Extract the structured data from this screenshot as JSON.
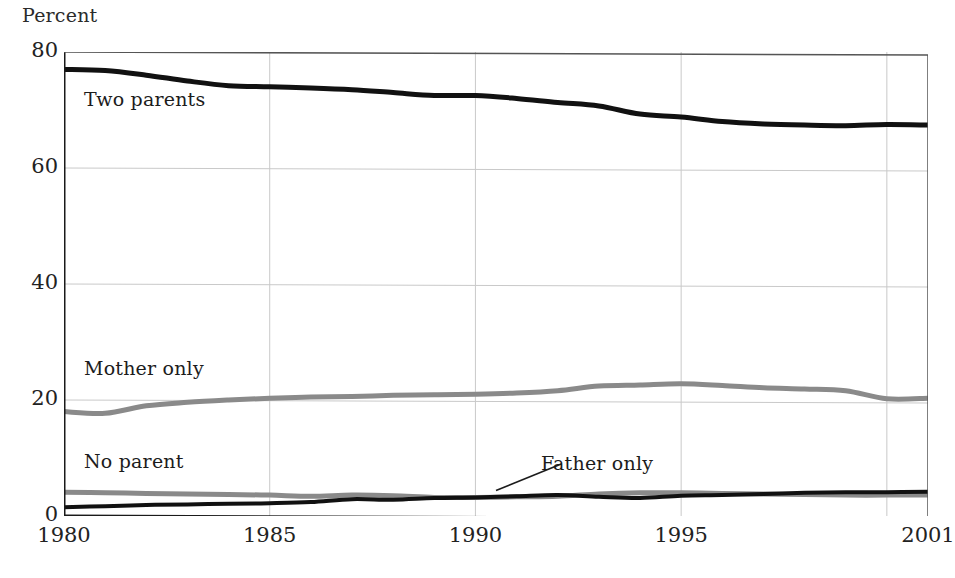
{
  "chart_data": {
    "type": "line",
    "title": "",
    "subtitle": "",
    "xlabel": "",
    "ylabel": "Percent",
    "xlim": [
      1980,
      2001
    ],
    "ylim": [
      0,
      80
    ],
    "grid": true,
    "legend_position": "inline-labels",
    "x_ticks": [
      "1980",
      "1985",
      "1990",
      "1995",
      "2001"
    ],
    "x_tick_values": [
      1980,
      1985,
      1990,
      1995,
      2001
    ],
    "y_ticks": [
      "0",
      "20",
      "40",
      "60",
      "80"
    ],
    "y_tick_values": [
      0,
      20,
      40,
      60,
      80
    ],
    "x": [
      1980,
      1981,
      1982,
      1983,
      1984,
      1985,
      1986,
      1987,
      1988,
      1989,
      1990,
      1991,
      1992,
      1993,
      1994,
      1995,
      1996,
      1997,
      1998,
      1999,
      2000,
      2001
    ],
    "series": [
      {
        "name": "Two parents",
        "color": "#111111",
        "width": 5,
        "values": [
          77,
          76.8,
          76,
          75,
          74.2,
          74,
          73.8,
          73.5,
          73,
          72.5,
          72.5,
          72,
          71.3,
          70.7,
          69.3,
          68.8,
          68,
          67.6,
          67.4,
          67.3,
          67.5,
          67.4
        ]
      },
      {
        "name": "Mother only",
        "color": "#8a8a8a",
        "width": 5,
        "values": [
          18,
          17.7,
          19,
          19.6,
          20,
          20.3,
          20.5,
          20.6,
          20.8,
          20.9,
          21,
          21.2,
          21.6,
          22.4,
          22.6,
          22.8,
          22.5,
          22.1,
          21.9,
          21.6,
          20.2,
          20.3
        ]
      },
      {
        "name": "No parent",
        "color": "#8a8a8a",
        "width": 5,
        "values": [
          4.1,
          4,
          3.9,
          3.8,
          3.7,
          3.6,
          3.4,
          3.6,
          3.5,
          3.2,
          3.2,
          3.3,
          3.4,
          3.8,
          4,
          4,
          3.9,
          3.8,
          3.7,
          3.6,
          3.6,
          3.6
        ]
      },
      {
        "name": "Father only",
        "color": "#111111",
        "width": 4,
        "values": [
          1.5,
          1.7,
          1.9,
          2,
          2.1,
          2.2,
          2.4,
          2.9,
          2.8,
          3.1,
          3.2,
          3.4,
          3.6,
          3.3,
          3.1,
          3.5,
          3.6,
          3.8,
          4,
          4.1,
          4.1,
          4.2
        ]
      }
    ],
    "annotations": [
      {
        "text": "Two parents",
        "x": 1982.1,
        "y": 71.0
      },
      {
        "text": "Mother only",
        "x": 1982.1,
        "y": 25.4
      },
      {
        "text": "No parent",
        "x": 1982.1,
        "y": 9.4
      },
      {
        "text": "Father only",
        "x": 1991.7,
        "y": 9.1,
        "leader_line": true
      }
    ],
    "colors": {
      "two_parents": "#111111",
      "mother_only": "#8a8a8a",
      "no_parent": "#8a8a8a",
      "father_only": "#111111",
      "grid": "#c9c9c9",
      "axis": "#1a1a1a",
      "background": "#ffffff",
      "text": "#222222"
    }
  },
  "labels": {
    "percent": "Percent",
    "two_parents": "Two parents",
    "mother_only": "Mother only",
    "no_parent": "No parent",
    "father_only": "Father only"
  }
}
